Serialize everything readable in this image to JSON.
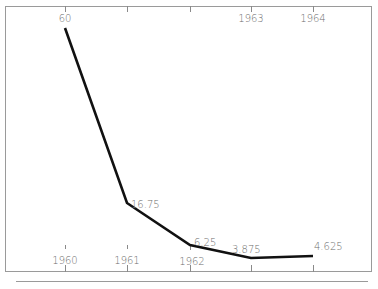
{
  "chart_data": {
    "type": "line",
    "title": "",
    "xlabel": "",
    "ylabel": "",
    "categories": [
      "1960",
      "1961",
      "1962",
      "1963",
      "1964"
    ],
    "series": [
      {
        "name": "series-1",
        "values": [
          60,
          16.75,
          6.25,
          3.875,
          4.625
        ]
      }
    ],
    "data_labels": [
      "60",
      "16.75",
      "6.25",
      "3.875",
      "4.625"
    ],
    "top_labels": [
      "60",
      "",
      "",
      "1963",
      "1964"
    ],
    "ylim": [
      0,
      65
    ],
    "grid": false,
    "legend": "none",
    "line_color": "#111111",
    "axis_color": "#8a8a8a",
    "label_color": "#6d6d6d"
  }
}
